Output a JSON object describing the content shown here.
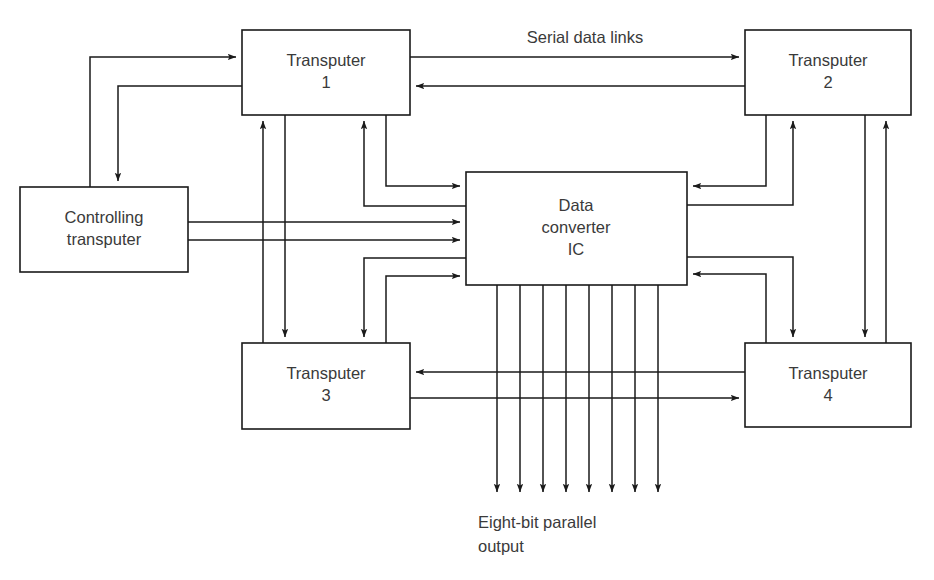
{
  "diagram": {
    "background_color": "#ffffff",
    "line_color": "#1a1a1a",
    "text_color": "#3a3a3a",
    "blocks": [
      {
        "id": "transputer-1",
        "name": "transputer-1-block",
        "line1": "Transputer",
        "line2": "1",
        "x": 242,
        "y": 30,
        "w": 168,
        "h": 85
      },
      {
        "id": "transputer-2",
        "name": "transputer-2-block",
        "line1": "Transputer",
        "line2": "2",
        "x": 745,
        "y": 30,
        "w": 166,
        "h": 85
      },
      {
        "id": "controlling-transputer",
        "name": "controlling-transputer-block",
        "line1": "Controlling",
        "line2": "transputer",
        "x": 20,
        "y": 187,
        "w": 168,
        "h": 85
      },
      {
        "id": "data-converter-ic",
        "name": "data-converter-ic-block",
        "line1": "Data",
        "line2": "converter",
        "line3": "IC",
        "x": 466,
        "y": 172,
        "w": 221,
        "h": 113
      },
      {
        "id": "transputer-3",
        "name": "transputer-3-block",
        "line1": "Transputer",
        "line2": "3",
        "x": 242,
        "y": 343,
        "w": 168,
        "h": 86
      },
      {
        "id": "transputer-4",
        "name": "transputer-4-block",
        "line1": "Transputer",
        "line2": "4",
        "x": 745,
        "y": 343,
        "w": 166,
        "h": 84
      }
    ],
    "annotations": [
      {
        "id": "serial-data-links",
        "name": "serial-data-links-label",
        "text": "Serial data links",
        "x": 585,
        "y": 39
      },
      {
        "id": "eight-bit-output",
        "name": "eight-bit-parallel-output-label",
        "line1": "Eight-bit parallel",
        "line2": "output",
        "x": 505,
        "y": 525
      }
    ],
    "bus": {
      "name": "eight-bit-parallel-output-bus",
      "line_count": 8,
      "x_positions": [
        497,
        520,
        543,
        566,
        589,
        612,
        635,
        658
      ],
      "y_top": 285,
      "y_bottom": 498
    }
  }
}
